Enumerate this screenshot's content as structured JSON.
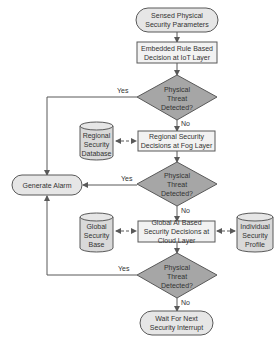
{
  "diagram": {
    "type": "flowchart",
    "colors": {
      "terminal_fill": "#e6e6e6",
      "process_fill": "#f2f2f2",
      "decision_fill": "#a6a6a6",
      "database_fill": "#d9d9d9",
      "stroke": "#595959",
      "text": "#333333"
    },
    "nodes": {
      "start": {
        "label": "Sensed Physical Security Parameters",
        "shape": "terminal"
      },
      "iot_decision": {
        "label": "Embedded Rule Based Decision at IoT Layer",
        "shape": "process"
      },
      "threat1": {
        "label": "Physical Threat Detected?",
        "shape": "decision"
      },
      "regional_db": {
        "label": "Regional Security Database",
        "shape": "database"
      },
      "fog_decision": {
        "label": "Regional Security Decisions at Fog Layer",
        "shape": "process"
      },
      "threat2": {
        "label": "Physical Threat Detected?",
        "shape": "decision"
      },
      "alarm": {
        "label": "Generate Alarm",
        "shape": "terminal"
      },
      "global_base": {
        "label": "Global Security Base",
        "shape": "database"
      },
      "cloud_decision": {
        "label": "Global AI Based Security Decisions at Cloud Layer",
        "shape": "process"
      },
      "individual_profile": {
        "label": "Individual Security Profile",
        "shape": "database"
      },
      "threat3": {
        "label": "Physical Threat Detected?",
        "shape": "decision"
      },
      "wait": {
        "label": "Wait For Next Security Interrupt",
        "shape": "terminal"
      }
    },
    "edge_labels": {
      "yes1": "Yes",
      "no1": "No",
      "yes2": "Yes",
      "no2": "No",
      "yes3": "Yes",
      "no3": "No"
    },
    "edges": [
      {
        "from": "start",
        "to": "iot_decision"
      },
      {
        "from": "iot_decision",
        "to": "threat1"
      },
      {
        "from": "threat1",
        "to": "alarm",
        "label": "Yes"
      },
      {
        "from": "threat1",
        "to": "fog_decision",
        "label": "No"
      },
      {
        "from": "regional_db",
        "to": "fog_decision",
        "style": "dashed",
        "bidirectional": true
      },
      {
        "from": "fog_decision",
        "to": "threat2"
      },
      {
        "from": "threat2",
        "to": "alarm",
        "label": "Yes"
      },
      {
        "from": "threat2",
        "to": "cloud_decision",
        "label": "No"
      },
      {
        "from": "global_base",
        "to": "cloud_decision",
        "style": "dashed",
        "bidirectional": true
      },
      {
        "from": "individual_profile",
        "to": "cloud_decision",
        "style": "dashed",
        "bidirectional": true
      },
      {
        "from": "cloud_decision",
        "to": "threat3"
      },
      {
        "from": "threat3",
        "to": "alarm",
        "label": "Yes"
      },
      {
        "from": "threat3",
        "to": "wait",
        "label": "No"
      }
    ]
  }
}
